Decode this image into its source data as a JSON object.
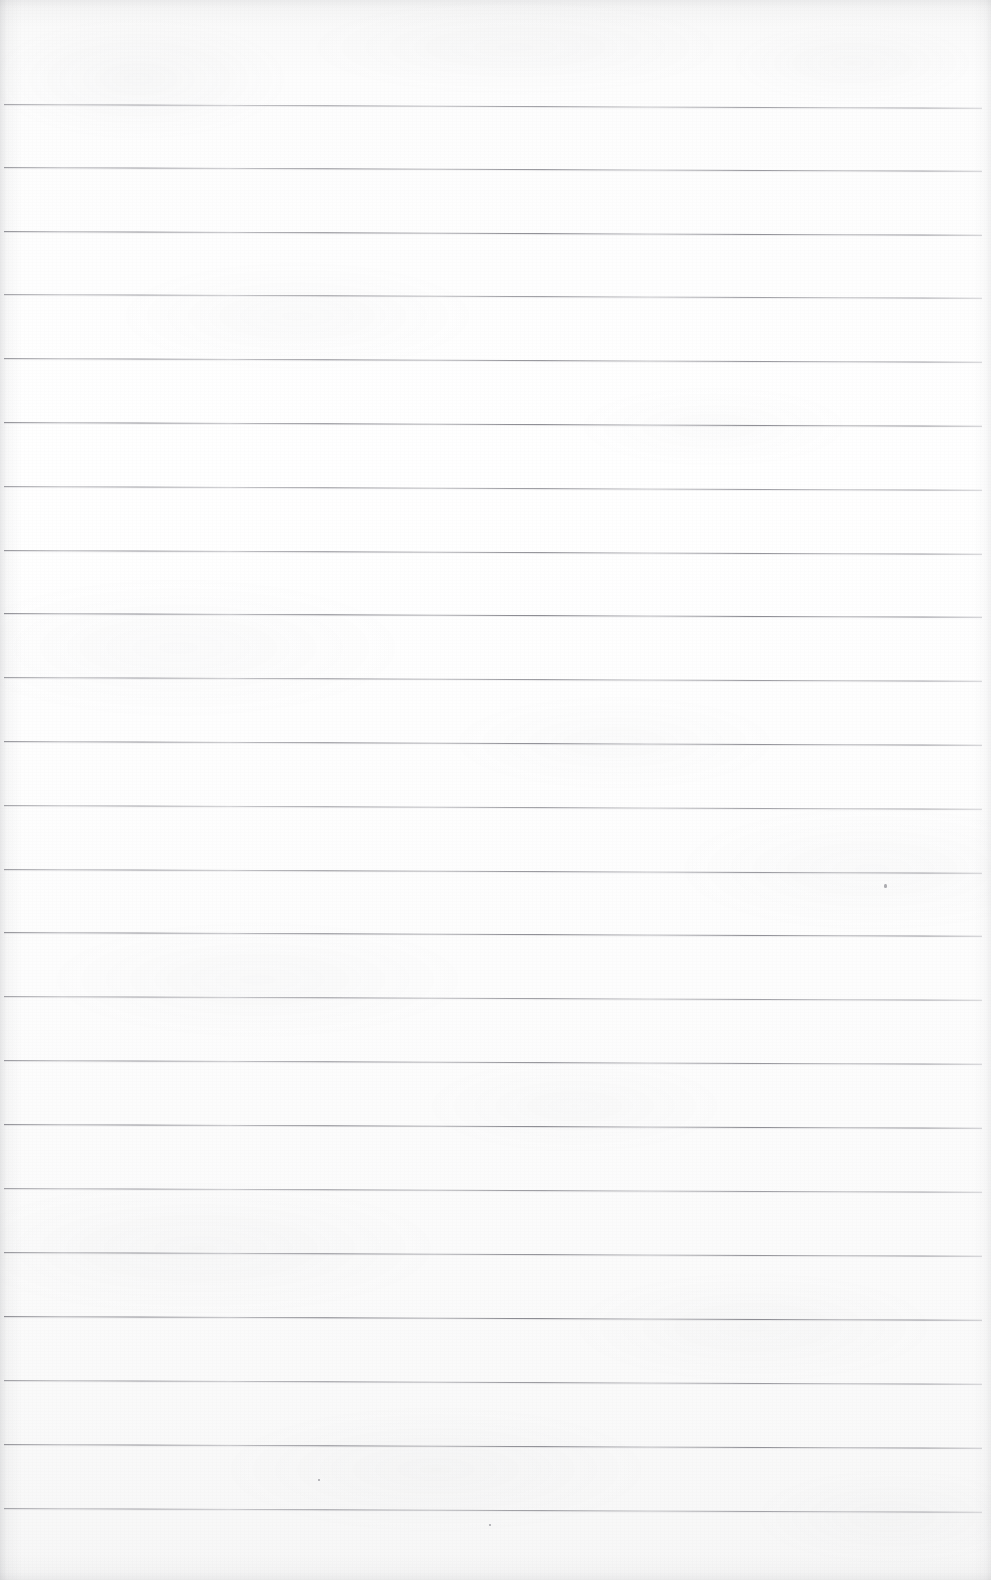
{
  "document": {
    "kind": "scanned-ruled-notebook-page",
    "title": "Blank Ruled Notebook Page",
    "text_content": "",
    "handwriting_present": false,
    "printed_text_present": false,
    "width_px": 991,
    "height_px": 1580
  },
  "paper": {
    "background_color": "#fcfcfc",
    "tint_color": "#f7f7f8",
    "grain_color": "#8c8e94",
    "vignette_color": "#787a80",
    "edge_shadow_side": "left"
  },
  "ruling": {
    "line_color": "#8a8a90",
    "line_thickness_px": 1,
    "line_count": 23,
    "first_line_y": 104,
    "line_spacing_px": 63.8,
    "line_start_x": 4,
    "line_end_x": 982,
    "tilt_degrees": 0.22,
    "top_margin_px": 104,
    "bottom_margin_px": 72,
    "left_margin_px": 4,
    "right_margin_px": 9,
    "has_vertical_margin_rule": false,
    "lines_y": [
      104,
      167,
      231,
      294,
      358,
      422,
      486,
      550,
      613,
      677,
      741,
      805,
      869,
      932,
      996,
      1060,
      1124,
      1188,
      1252,
      1316,
      1380,
      1444,
      1508
    ]
  },
  "marks": {
    "specks": [
      {
        "x": 884,
        "y": 884,
        "w": 3,
        "h": 4
      },
      {
        "x": 318,
        "y": 1479,
        "w": 2,
        "h": 2
      },
      {
        "x": 489,
        "y": 1524,
        "w": 2,
        "h": 2
      }
    ]
  }
}
